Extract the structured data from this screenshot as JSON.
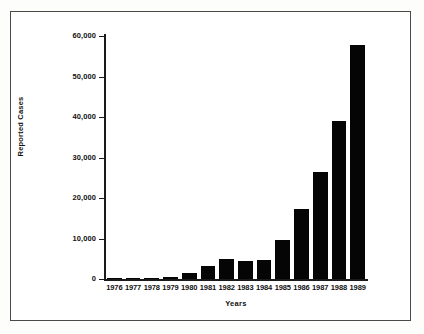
{
  "chart_data": {
    "type": "bar",
    "title": "",
    "subtitle": "",
    "xlabel": "Years",
    "ylabel": "Reported Cases",
    "categories": [
      "1976",
      "1977",
      "1978",
      "1979",
      "1980",
      "1981",
      "1982",
      "1983",
      "1984",
      "1985",
      "1986",
      "1987",
      "1988",
      "1989"
    ],
    "values": [
      100,
      300,
      200,
      500,
      1600,
      3200,
      5000,
      4400,
      4700,
      9600,
      17300,
      26400,
      39000,
      57800
    ],
    "ylim": [
      0,
      60000
    ],
    "ytick_labels": [
      "0",
      "10,000",
      "20,000",
      "30,000",
      "40,000",
      "50,000",
      "60,000"
    ],
    "ytick_values": [
      0,
      10000,
      20000,
      30000,
      40000,
      50000,
      60000
    ],
    "grid": false,
    "legend": false,
    "bar_color": "#050505",
    "axis_color": "#1a1a1a",
    "background_color": "#ffffff"
  }
}
